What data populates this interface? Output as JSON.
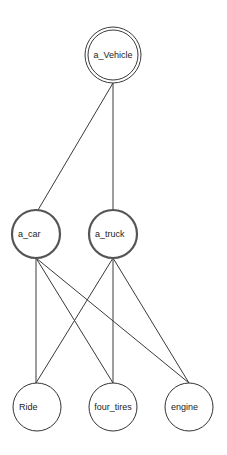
{
  "diagram": {
    "type": "graph",
    "nodes": [
      {
        "id": "a_Vehicle",
        "label": "a_Vehicle",
        "style": "double"
      },
      {
        "id": "a_car",
        "label": "a_car",
        "style": "thick"
      },
      {
        "id": "a_truck",
        "label": "a_truck",
        "style": "thick"
      },
      {
        "id": "Ride",
        "label": "Ride",
        "style": "plain"
      },
      {
        "id": "four_tires",
        "label": "four_tires",
        "style": "plain"
      },
      {
        "id": "engine",
        "label": "engine",
        "style": "plain"
      }
    ],
    "edges": [
      {
        "from": "a_Vehicle",
        "to": "a_car"
      },
      {
        "from": "a_Vehicle",
        "to": "a_truck"
      },
      {
        "from": "a_car",
        "to": "Ride"
      },
      {
        "from": "a_car",
        "to": "four_tires"
      },
      {
        "from": "a_car",
        "to": "engine"
      },
      {
        "from": "a_truck",
        "to": "Ride"
      },
      {
        "from": "a_truck",
        "to": "four_tires"
      },
      {
        "from": "a_truck",
        "to": "engine"
      }
    ]
  },
  "labels": {
    "vehicle": "a_Vehicle",
    "car": "a_car",
    "truck": "a_truck",
    "ride": "Ride",
    "four_tires": "four_tires",
    "engine": "engine"
  }
}
